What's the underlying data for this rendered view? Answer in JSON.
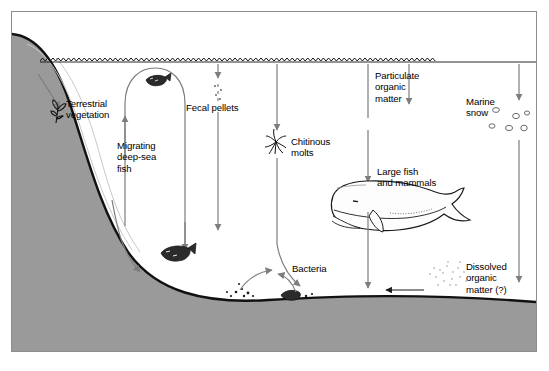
{
  "figure": {
    "background_color": "#ffffff",
    "frame_color": "#8d8d8d",
    "seafloor_color": "#9a9a9a",
    "line_color": "#7d7d7d",
    "ink_color": "#000000"
  },
  "labels": {
    "terrestrial_vegetation": "Terrestrial\nvegetation",
    "migrating_deep_sea_fish": "Migrating\ndeep-sea\nfish",
    "fecal_pellets": "Fecal pellets",
    "chitinous_molts": "Chitinous\nmolts",
    "particulate_organic_matter": "Particulate\norganic\nmatter",
    "marine_snow": "Marine\nsnow",
    "large_fish_and_mammals": "Large fish\nand mammals",
    "bacteria": "Bacteria",
    "dissolved_organic_matter": "Dissolved\norganic\nmatter (?)"
  },
  "elements": {
    "water_surface": "wavy-water-surface-line",
    "continental_slope": "gray-continental-slope",
    "seafloor": "gray-seafloor",
    "whale": "sperm-whale-illustration",
    "fish_surface": "small-fish-icon",
    "fish_deep": "small-fish-icon",
    "plant": "terrestrial-plant-icon",
    "molt": "chitinous-molt-icon",
    "marine_snow_flakes": "marine-snow-flake-icons",
    "dom_cloud": "dissolved-organic-matter-stipple-cloud",
    "detritus_left": "seafloor-detritus-cluster",
    "detritus_right": "seafloor-detritus-cluster"
  },
  "arrows": {
    "terrestrial_downslope": "downslope-arrow",
    "fish_migration_loop": "fish-migration-loop-arrow",
    "fecal_pellets_fall": "dashed-falling-arrow",
    "fecal_pellets_long": "long-vertical-arrow",
    "molt_fall": "vertical-arrow",
    "molt_long": "long-vertical-arrow",
    "pom_fall": "vertical-arrow",
    "marine_snow_fall": "vertical-arrow",
    "whale_fall": "vertical-arrow",
    "bacteria_left": "curved-arrow-to-bacteria",
    "bacteria_right": "curved-arrow-to-bacteria",
    "dom_transfer": "leftward-arrow",
    "curve_to_floor_a": "curved-settling-arrow",
    "curve_to_floor_b": "curved-settling-arrow"
  }
}
